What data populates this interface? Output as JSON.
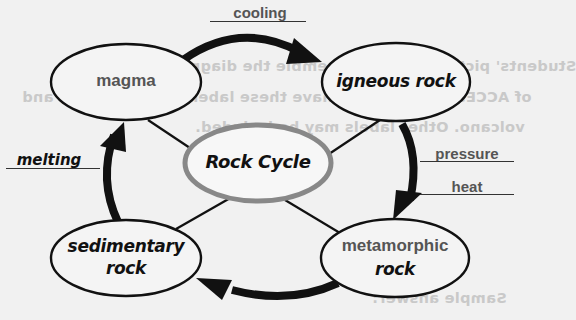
{
  "diagram": {
    "title": "Rock Cycle",
    "nodes": [
      {
        "id": "magma",
        "label": "magma"
      },
      {
        "id": "igneous",
        "label": "igneous rock"
      },
      {
        "id": "metamorphic",
        "line1": "metamorphic",
        "line2": "rock"
      },
      {
        "id": "sedimentary",
        "line1": "sedimentary",
        "line2": "rock"
      }
    ],
    "processes": {
      "cooling": "cooling",
      "pressure": "pressure",
      "heat": "heat",
      "melting": "melting"
    },
    "edges": [
      {
        "from": "magma",
        "to": "igneous",
        "label": "cooling"
      },
      {
        "from": "igneous",
        "to": "metamorphic",
        "label": "pressure, heat"
      },
      {
        "from": "metamorphic",
        "to": "sedimentary",
        "label": ""
      },
      {
        "from": "sedimentary",
        "to": "magma",
        "label": "melting"
      }
    ]
  },
  "bleed_through": {
    "line1": "Students' pictures should resemble the diagram on page 36",
    "line2": "of ACCESS Science and have these labels: magma, lava, and",
    "line3": "volcano. Other labels may be included.",
    "line4": "Sample answer:"
  }
}
